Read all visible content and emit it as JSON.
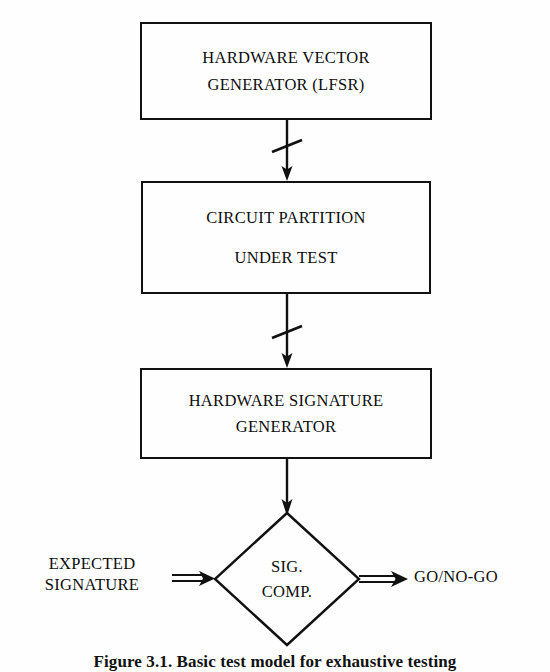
{
  "figure": {
    "caption": "Figure 3.1. Basic test model for exhaustive testing",
    "background_color": "#fefefe",
    "ink_color": "#111111"
  },
  "blocks": [
    {
      "id": "vector-generator",
      "lines": [
        "HARDWARE VECTOR",
        "GENERATOR (LFSR)"
      ]
    },
    {
      "id": "circuit-partition",
      "lines": [
        "CIRCUIT PARTITION",
        "UNDER TEST"
      ]
    },
    {
      "id": "signature-generator",
      "lines": [
        "HARDWARE SIGNATURE",
        "GENERATOR"
      ]
    }
  ],
  "decision": {
    "id": "sig-comp",
    "lines": [
      "SIG.",
      "COMP."
    ],
    "shape": "diamond"
  },
  "labels": {
    "input_left": [
      "EXPECTED",
      "SIGNATURE"
    ],
    "output_right": [
      "GO/NO-GO"
    ]
  },
  "connectors": [
    {
      "id": "generator-to-partition",
      "from": "vector-generator",
      "to": "circuit-partition",
      "bus_slash": true,
      "arrowhead": "down"
    },
    {
      "id": "partition-to-signature",
      "from": "circuit-partition",
      "to": "signature-generator",
      "bus_slash": true,
      "arrowhead": "down"
    },
    {
      "id": "signature-to-comparator",
      "from": "signature-generator",
      "to": "sig-comp",
      "bus_slash": false,
      "arrowhead": "down"
    },
    {
      "id": "expected-to-comparator",
      "from": "input_left",
      "to": "sig-comp",
      "bus_slash": false,
      "arrowhead": "right"
    },
    {
      "id": "comparator-to-result",
      "from": "sig-comp",
      "to": "output_right",
      "bus_slash": false,
      "arrowhead": "right"
    }
  ]
}
